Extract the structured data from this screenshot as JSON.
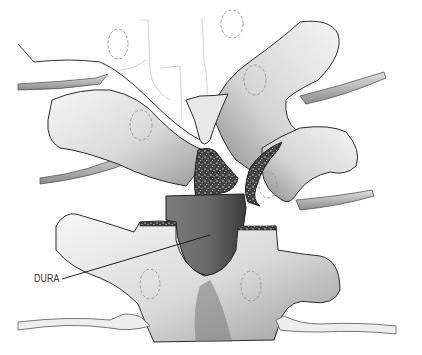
{
  "figure": {
    "labels": [
      {
        "id": "dura",
        "text": "DURA",
        "x": 34,
        "y": 270
      }
    ],
    "colors": {
      "background": "#ffffff",
      "bone_light": "#f2f2f2",
      "bone_mid": "#c8c8c8",
      "bone_shadow": "#8a8a8a",
      "dura": "#6e6e6e",
      "dura_dark": "#3a3a3a",
      "outline": "#2a2a2a",
      "dashed_outline": "#9a9a9a",
      "cancellous_bone": "#4a4a4a"
    }
  }
}
